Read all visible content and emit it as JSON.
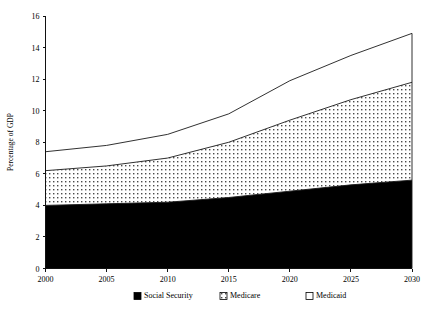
{
  "chart_data": {
    "type": "area",
    "stacked": true,
    "title": "",
    "xlabel": "",
    "ylabel": "Percentage of GDP",
    "xlim": [
      2000,
      2030
    ],
    "ylim": [
      0,
      16
    ],
    "grid": false,
    "legend_position": "bottom",
    "x": [
      2000,
      2005,
      2010,
      2015,
      2020,
      2025,
      2030
    ],
    "xticks": [
      "2000",
      "2005",
      "2010",
      "2015",
      "2020",
      "2025",
      "2030"
    ],
    "yticks": [
      "0",
      "2",
      "4",
      "6",
      "8",
      "10",
      "12",
      "14",
      "16"
    ],
    "series": [
      {
        "name": "Social Security",
        "fill": "solid-black",
        "color": "#000000",
        "values": [
          4.0,
          4.1,
          4.2,
          4.5,
          4.9,
          5.3,
          5.6
        ]
      },
      {
        "name": "Medicare",
        "fill": "dotted-pattern",
        "color": "#ffffff",
        "values": [
          2.2,
          2.4,
          2.8,
          3.5,
          4.5,
          5.4,
          6.2
        ]
      },
      {
        "name": "Medicaid",
        "fill": "white",
        "color": "#ffffff",
        "values": [
          1.2,
          1.3,
          1.5,
          1.8,
          2.5,
          2.8,
          3.1
        ]
      }
    ],
    "cumulative_totals": {
      "social_security": [
        4.0,
        4.1,
        4.2,
        4.5,
        4.9,
        5.3,
        5.6
      ],
      "through_medicare": [
        6.2,
        6.5,
        7.0,
        8.0,
        9.4,
        10.7,
        11.8
      ],
      "through_medicaid": [
        7.4,
        7.8,
        8.5,
        9.8,
        11.9,
        13.5,
        14.9
      ]
    }
  },
  "legend": {
    "items": [
      {
        "label": "Social Security",
        "swatch": "solid-black"
      },
      {
        "label": "Medicare",
        "swatch": "dotted-pattern"
      },
      {
        "label": "Medicaid",
        "swatch": "white"
      }
    ]
  }
}
